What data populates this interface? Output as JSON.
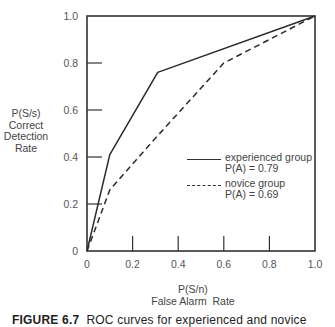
{
  "chart_data": {
    "type": "line",
    "title": "",
    "xlabel": "P(S/n) False Alarm Rate",
    "ylabel": "P(S/s) Correct Detection Rate",
    "xlim": [
      0,
      1.0
    ],
    "ylim": [
      0,
      1.0
    ],
    "x_ticks": [
      "0",
      "0.2",
      "0.4",
      "0.6",
      "0.8",
      "1.0"
    ],
    "y_ticks": [
      "0",
      "0.2",
      "0.4",
      "0.6",
      "0.8",
      "1.0"
    ],
    "grid": false,
    "legend_position": "lower right (inside plot)",
    "series": [
      {
        "name": "experienced group",
        "annotation": "P(A) = 0.79",
        "style": "solid",
        "points": [
          [
            0,
            0
          ],
          [
            0.1,
            0.41
          ],
          [
            0.31,
            0.76
          ],
          [
            1.0,
            1.0
          ]
        ]
      },
      {
        "name": "novice group",
        "annotation": "P(A) = 0.69",
        "style": "dashed",
        "points": [
          [
            0,
            0
          ],
          [
            0.1,
            0.26
          ],
          [
            0.3,
            0.48
          ],
          [
            0.6,
            0.8
          ],
          [
            1.0,
            1.0
          ]
        ]
      }
    ]
  },
  "axis": {
    "y_title_lines": [
      "P(S/s)",
      "Correct",
      "Detection",
      "Rate"
    ],
    "x_title_lines": [
      "P(S/n)",
      "False Alarm  Rate"
    ]
  },
  "legend": {
    "items": [
      {
        "label": "experienced group",
        "value": "P(A) = 0.79"
      },
      {
        "label": "novice group",
        "value": "P(A) = 0.69"
      }
    ]
  },
  "caption": {
    "prefix": "FIGURE 6.7",
    "text": "ROC curves for experienced and novice"
  }
}
